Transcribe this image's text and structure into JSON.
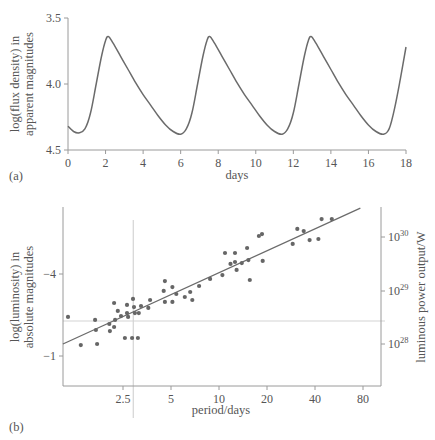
{
  "chart_data": [
    {
      "panel": "(a)",
      "type": "line",
      "title": "",
      "xlabel": "days",
      "ylabel_lines": [
        "log(flux density) in",
        "apparent magnitudes"
      ],
      "xlim": [
        0,
        18
      ],
      "ylim": [
        4.5,
        3.5
      ],
      "y_inverted": true,
      "xticks": [
        0,
        2,
        4,
        6,
        8,
        10,
        12,
        14,
        16,
        18
      ],
      "yticks": [
        "3.5",
        "4.0",
        "4.5"
      ],
      "ytick_values": [
        3.5,
        4.0,
        4.5
      ],
      "grid": false,
      "series": [
        {
          "name": "light curve",
          "x": [
            0,
            0.3,
            0.6,
            0.9,
            1.2,
            1.5,
            1.8,
            2.0,
            2.15,
            2.4,
            2.8,
            3.2,
            3.6,
            4.0,
            4.4,
            4.8,
            5.2,
            5.6,
            6.0,
            6.3,
            6.6,
            6.9,
            7.2,
            7.4,
            7.55,
            7.8,
            8.2,
            8.6,
            9.0,
            9.4,
            9.8,
            10.2,
            10.6,
            11.0,
            11.4,
            11.7,
            12.0,
            12.3,
            12.6,
            12.8,
            12.95,
            13.2,
            13.6,
            14.0,
            14.4,
            14.8,
            15.2,
            15.6,
            16.0,
            16.4,
            16.8,
            17.1,
            17.4,
            17.7,
            18.0
          ],
          "values": [
            4.32,
            4.36,
            4.37,
            4.34,
            4.22,
            4.0,
            3.78,
            3.67,
            3.64,
            3.69,
            3.79,
            3.89,
            3.99,
            4.08,
            4.16,
            4.24,
            4.31,
            4.36,
            4.38,
            4.34,
            4.22,
            4.0,
            3.78,
            3.67,
            3.64,
            3.69,
            3.79,
            3.89,
            3.99,
            4.08,
            4.16,
            4.24,
            4.31,
            4.36,
            4.38,
            4.34,
            4.22,
            4.0,
            3.78,
            3.67,
            3.64,
            3.69,
            3.79,
            3.89,
            3.99,
            4.08,
            4.16,
            4.24,
            4.31,
            4.36,
            4.38,
            4.34,
            4.18,
            3.96,
            3.72
          ]
        }
      ]
    },
    {
      "panel": "(b)",
      "type": "scatter",
      "title": "",
      "xlabel": "period/days",
      "x_scale": "log",
      "ylabel_lines": [
        "log(luminosity) in",
        "absolute magnitudes"
      ],
      "ylabel_right": "luminous power output/W",
      "xticks": [
        "2.5",
        "5",
        "10",
        "20",
        "40",
        "80"
      ],
      "xtick_values": [
        2.5,
        5,
        10,
        20,
        40,
        80
      ],
      "yticks_left": [
        "−4",
        "−1"
      ],
      "ytick_left_values": [
        -4,
        -1
      ],
      "yticks_right": [
        {
          "base": "10",
          "exp": "30"
        },
        {
          "base": "10",
          "exp": "29"
        },
        {
          "base": "10",
          "exp": "28"
        }
      ],
      "reference_lines": {
        "vertical_period": 2.9,
        "horizontal_magnitude": -2.28
      },
      "grid": false,
      "points": [
        [
          1.13,
          -2.43
        ],
        [
          1.36,
          -1.4
        ],
        [
          1.67,
          -2.32
        ],
        [
          1.69,
          -1.95
        ],
        [
          1.72,
          -1.44
        ],
        [
          2.05,
          -2.17
        ],
        [
          2.07,
          -1.91
        ],
        [
          2.2,
          -2.94
        ],
        [
          2.2,
          -2.06
        ],
        [
          2.23,
          -2.32
        ],
        [
          2.32,
          -2.65
        ],
        [
          2.43,
          -2.46
        ],
        [
          2.57,
          -1.66
        ],
        [
          2.65,
          -2.87
        ],
        [
          2.65,
          -2.57
        ],
        [
          2.69,
          -2.43
        ],
        [
          2.85,
          -1.66
        ],
        [
          2.89,
          -3.09
        ],
        [
          2.93,
          -2.79
        ],
        [
          2.97,
          -2.57
        ],
        [
          3.1,
          -1.66
        ],
        [
          3.14,
          -2.57
        ],
        [
          3.24,
          -2.83
        ],
        [
          3.6,
          -2.76
        ],
        [
          3.7,
          -3.05
        ],
        [
          4.5,
          -3.38
        ],
        [
          4.58,
          -3.74
        ],
        [
          4.58,
          -2.98
        ],
        [
          5.1,
          -3.52
        ],
        [
          5.1,
          -2.98
        ],
        [
          5.4,
          -3.27
        ],
        [
          6.1,
          -3.16
        ],
        [
          6.6,
          -3.34
        ],
        [
          6.8,
          -3.05
        ],
        [
          7.5,
          -3.56
        ],
        [
          8.8,
          -3.82
        ],
        [
          10.5,
          -3.96
        ],
        [
          10.9,
          -4.77
        ],
        [
          11.8,
          -4.37
        ],
        [
          12.6,
          -4.77
        ],
        [
          12.9,
          -4.15
        ],
        [
          12.6,
          -4.44
        ],
        [
          13.9,
          -4.4
        ],
        [
          15.0,
          -4.95
        ],
        [
          15.3,
          -4.51
        ],
        [
          15.6,
          -3.78
        ],
        [
          17.8,
          -5.39
        ],
        [
          18.6,
          -5.46
        ],
        [
          18.8,
          -4.48
        ],
        [
          29,
          -5.1
        ],
        [
          31,
          -5.65
        ],
        [
          34,
          -5.57
        ],
        [
          37,
          -5.24
        ],
        [
          42,
          -5.28
        ],
        [
          44,
          -6.01
        ],
        [
          51,
          -6.01
        ]
      ],
      "fit_line": {
        "x": [
          1.05,
          77
        ],
        "y": [
          -1.44,
          -6.41
        ]
      }
    }
  ],
  "colors": {
    "curve": "#6b6b6b",
    "axis": "#9a9a9a",
    "points": "#666666",
    "fit": "#6b6b6b",
    "reference": "#d4d4d4",
    "text": "#555555"
  }
}
